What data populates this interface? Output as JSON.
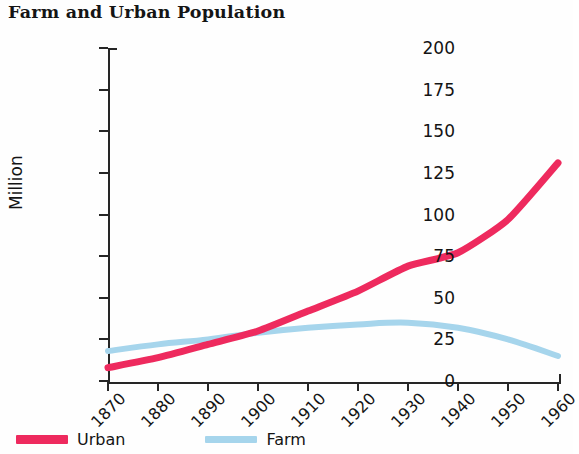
{
  "chart_data": {
    "type": "line",
    "title": "Farm and Urban Population",
    "xlabel": "",
    "ylabel": "Million",
    "x": [
      1870,
      1880,
      1890,
      1900,
      1910,
      1920,
      1930,
      1940,
      1950,
      1960
    ],
    "xtick_labels": [
      "1870",
      "1880",
      "1890",
      "1900",
      "1910",
      "1920",
      "1930",
      "1940",
      "1950",
      "1960"
    ],
    "xlim": [
      1870,
      1960
    ],
    "ylim": [
      0,
      200
    ],
    "ytick_labels": [
      "0",
      "25",
      "50",
      "75",
      "100",
      "125",
      "150",
      "175",
      "200"
    ],
    "ytick_values": [
      0,
      25,
      50,
      75,
      100,
      125,
      150,
      175,
      200
    ],
    "grid": false,
    "legend_position": "below-left",
    "series": [
      {
        "name": "Urban",
        "color": "#EE2A5E",
        "values": [
          8,
          14,
          22,
          30,
          42,
          54,
          69,
          77,
          97,
          131
        ]
      },
      {
        "name": "Farm",
        "color": "#A6D5EC",
        "values": [
          18,
          22,
          25,
          29,
          32,
          34,
          35,
          32,
          25,
          15
        ]
      }
    ]
  },
  "legend": {
    "entries": [
      {
        "label": "Urban",
        "color": "#EE2A5E"
      },
      {
        "label": "Farm",
        "color": "#A6D5EC"
      }
    ]
  }
}
